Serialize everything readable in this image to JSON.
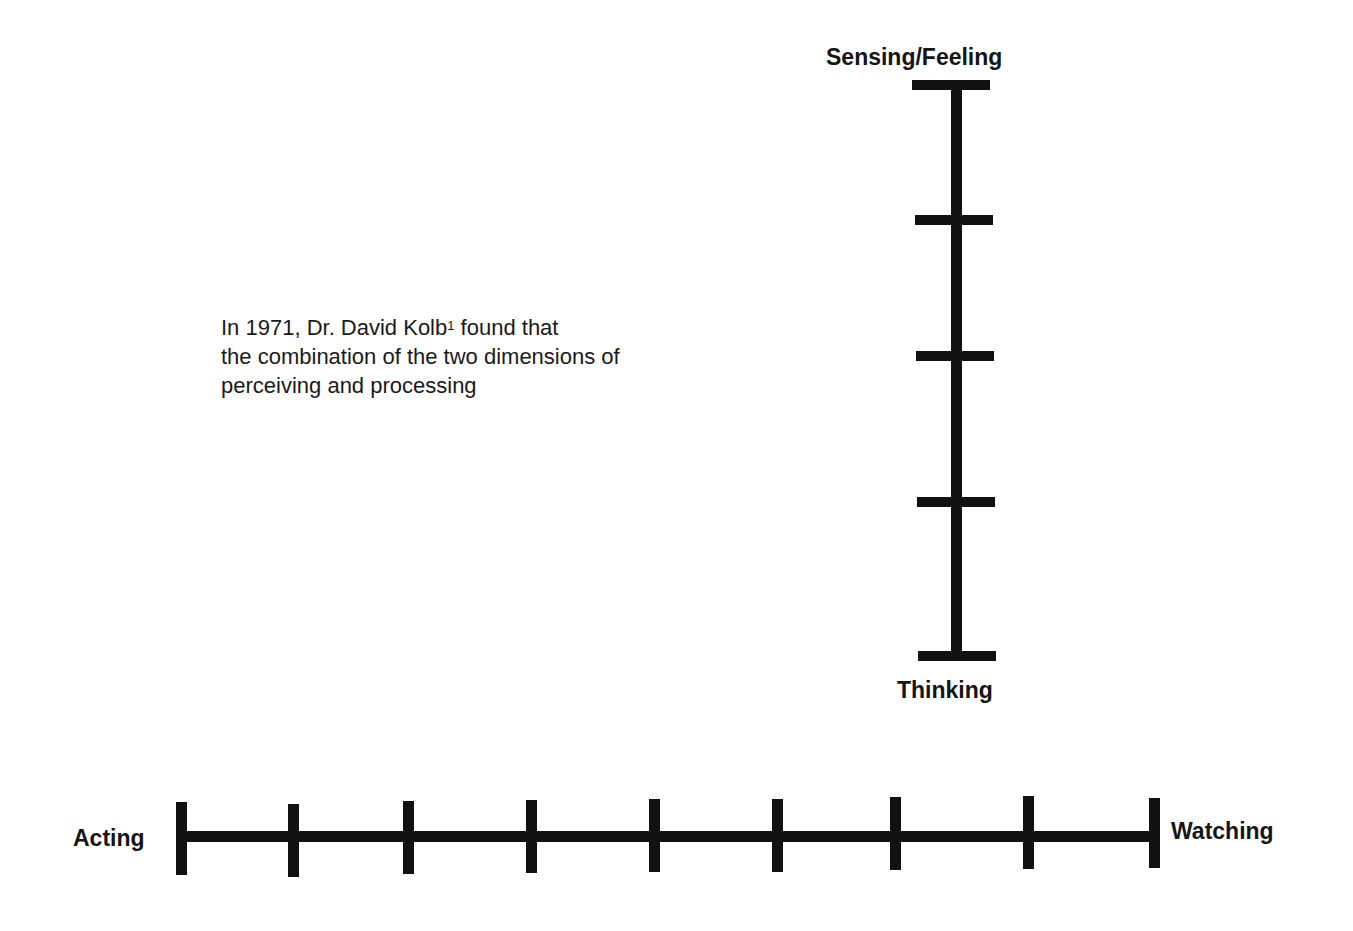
{
  "paragraph": {
    "line1_prefix": "In 1971, Dr. David Kolb",
    "line1_footnote": "1",
    "line1_suffix": " found that",
    "line2": "the combination of the two dimensions of",
    "line3": "perceiving and processing"
  },
  "vertical_axis": {
    "top_label": "Sensing/Feeling",
    "bottom_label": "Thinking",
    "tick_count": 5
  },
  "horizontal_axis": {
    "left_label": "Acting",
    "right_label": "Watching",
    "tick_count": 9
  },
  "colors": {
    "line": "#111111",
    "background": "#ffffff"
  }
}
